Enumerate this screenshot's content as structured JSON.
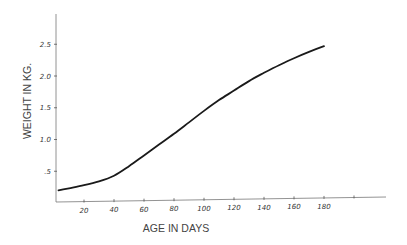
{
  "chart_data": {
    "type": "line",
    "title": "",
    "xlabel": "AGE IN DAYS",
    "ylabel": "WEIGHT IN KG.",
    "xlim": [
      0,
      200
    ],
    "ylim": [
      0,
      2.5
    ],
    "grid": false,
    "legend": null,
    "x_ticks": [
      20,
      40,
      60,
      80,
      100,
      120,
      140,
      160,
      180,
      200
    ],
    "x_tick_labels": [
      "20",
      "40",
      "60",
      "80",
      "100",
      "120",
      "140",
      "160",
      "180",
      ""
    ],
    "y_ticks": [
      0.5,
      1.0,
      1.5,
      2.0,
      2.5
    ],
    "y_tick_labels": [
      ".5",
      "1.0",
      "1.5",
      "2.0",
      "2.5"
    ],
    "series": [
      {
        "name": "weight",
        "x": [
          3,
          10,
          20,
          30,
          40,
          50,
          60,
          70,
          80,
          90,
          100,
          110,
          120,
          130,
          140,
          150,
          160,
          170,
          180
        ],
        "values": [
          0.2,
          0.23,
          0.28,
          0.34,
          0.43,
          0.58,
          0.75,
          0.92,
          1.09,
          1.27,
          1.45,
          1.62,
          1.77,
          1.92,
          2.05,
          2.17,
          2.28,
          2.38,
          2.47
        ]
      }
    ]
  },
  "plot": {
    "origin_x": 54,
    "origin_y": 203,
    "px_per_day": 1.5,
    "px_per_kg": 63.5
  }
}
